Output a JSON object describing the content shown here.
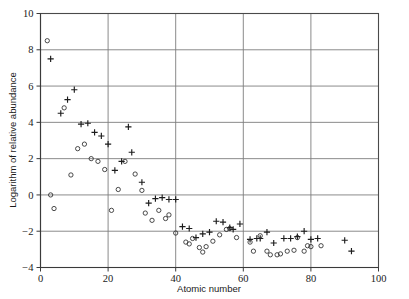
{
  "figure": {
    "background_color": "#ffffff",
    "width": 409,
    "height": 299
  },
  "chart_data": {
    "type": "scatter",
    "title": "",
    "subtitle": "",
    "xlabel": "Atomic number",
    "ylabel": "Logarithm of relative abundance",
    "xlim": [
      0,
      100
    ],
    "ylim": [
      -4,
      10
    ],
    "xticks": [
      0,
      20,
      40,
      60,
      80,
      100
    ],
    "yticks": [
      -4,
      -2,
      0,
      2,
      4,
      6,
      8,
      10
    ],
    "xtick_labels": [
      "0",
      "20",
      "40",
      "60",
      "80",
      "100"
    ],
    "ytick_labels": [
      "-4",
      "-2",
      "0",
      "2",
      "4",
      "6",
      "8",
      "10"
    ],
    "grid": true,
    "grid_axes": "both",
    "legend": false,
    "legend_position": "none",
    "marker_colors": {
      "plus": "#1c1c1c",
      "circle": "#2a2a2a"
    },
    "series": [
      {
        "name": "plus-markers",
        "marker": "plus",
        "points": [
          [
            3,
            7.5
          ],
          [
            6,
            4.5
          ],
          [
            8,
            5.25
          ],
          [
            10,
            5.8
          ],
          [
            12,
            3.9
          ],
          [
            14,
            3.95
          ],
          [
            16,
            3.45
          ],
          [
            18,
            3.25
          ],
          [
            20,
            2.8
          ],
          [
            22,
            1.35
          ],
          [
            24,
            1.85
          ],
          [
            26,
            3.75
          ],
          [
            27,
            2.35
          ],
          [
            30,
            0.7
          ],
          [
            32,
            -0.45
          ],
          [
            34,
            -0.2
          ],
          [
            36,
            -0.15
          ],
          [
            38,
            -0.25
          ],
          [
            40,
            -0.25
          ],
          [
            42,
            -1.75
          ],
          [
            44,
            -1.85
          ],
          [
            46,
            -2.35
          ],
          [
            48,
            -2.15
          ],
          [
            50,
            -2.05
          ],
          [
            52,
            -1.45
          ],
          [
            54,
            -1.5
          ],
          [
            56,
            -1.8
          ],
          [
            57,
            -1.9
          ],
          [
            59,
            -1.6
          ],
          [
            62,
            -2.45
          ],
          [
            64,
            -2.4
          ],
          [
            65,
            -2.4
          ],
          [
            67,
            -2.05
          ],
          [
            69,
            -2.65
          ],
          [
            72,
            -2.4
          ],
          [
            74,
            -2.4
          ],
          [
            76,
            -2.3
          ],
          [
            78,
            -2.0
          ],
          [
            80,
            -2.45
          ],
          [
            82,
            -2.4
          ],
          [
            90,
            -2.5
          ],
          [
            92,
            -3.1
          ]
        ]
      },
      {
        "name": "circle-markers",
        "marker": "circle",
        "points": [
          [
            2,
            8.5
          ],
          [
            3,
            0.0
          ],
          [
            4,
            -0.75
          ],
          [
            7,
            4.8
          ],
          [
            9,
            1.1
          ],
          [
            11,
            2.55
          ],
          [
            13,
            2.8
          ],
          [
            15,
            2.0
          ],
          [
            17,
            1.85
          ],
          [
            19,
            1.4
          ],
          [
            21,
            -0.85
          ],
          [
            23,
            0.3
          ],
          [
            25,
            1.85
          ],
          [
            28,
            1.15
          ],
          [
            30,
            0.25
          ],
          [
            31,
            -1.0
          ],
          [
            33,
            -1.4
          ],
          [
            35,
            -0.85
          ],
          [
            37,
            -1.3
          ],
          [
            38,
            -1.1
          ],
          [
            40,
            -2.1
          ],
          [
            43,
            -2.6
          ],
          [
            44,
            -2.7
          ],
          [
            45,
            -2.4
          ],
          [
            47,
            -2.9
          ],
          [
            48,
            -3.15
          ],
          [
            49,
            -2.85
          ],
          [
            51,
            -2.55
          ],
          [
            53,
            -2.2
          ],
          [
            55,
            -1.9
          ],
          [
            56,
            -1.85
          ],
          [
            58,
            -2.35
          ],
          [
            62,
            -2.6
          ],
          [
            63,
            -3.1
          ],
          [
            65,
            -2.25
          ],
          [
            67,
            -3.1
          ],
          [
            68,
            -3.3
          ],
          [
            70,
            -3.3
          ],
          [
            71,
            -3.25
          ],
          [
            73,
            -3.1
          ],
          [
            75,
            -3.05
          ],
          [
            76,
            -2.35
          ],
          [
            78,
            -3.1
          ],
          [
            79,
            -2.8
          ],
          [
            80,
            -2.85
          ],
          [
            83,
            -2.8
          ]
        ]
      }
    ]
  }
}
